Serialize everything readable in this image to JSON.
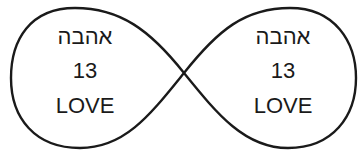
{
  "diagram": {
    "shape": "infinity-loop",
    "stroke_color": "#1a1a1a",
    "background": "#ffffff",
    "loops": [
      {
        "id": "left",
        "hebrew": "אהבה",
        "number": "13",
        "english": "LOVE"
      },
      {
        "id": "right",
        "hebrew": "אהבה",
        "number": "13",
        "english": "LOVE"
      }
    ]
  }
}
